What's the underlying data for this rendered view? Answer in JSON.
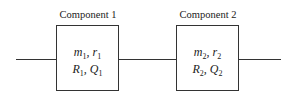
{
  "components": [
    {
      "label": "Component 1",
      "line1": [
        {
          "v": "m",
          "s": "1"
        },
        {
          "v": "r",
          "s": "1"
        }
      ],
      "line2": [
        {
          "v": "R",
          "s": "1"
        },
        {
          "v": "Q",
          "s": "1"
        }
      ]
    },
    {
      "label": "Component 2",
      "line1": [
        {
          "v": "m",
          "s": "2"
        },
        {
          "v": "r",
          "s": "2"
        }
      ],
      "line2": [
        {
          "v": "R",
          "s": "2"
        },
        {
          "v": "Q",
          "s": "2"
        }
      ]
    }
  ],
  "colors": {
    "line": "#333333",
    "background": "#ffffff"
  }
}
